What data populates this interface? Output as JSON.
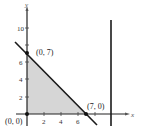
{
  "diagram": {
    "type": "feasible-region-graph",
    "axes": {
      "x_label": "x",
      "y_label": "y"
    },
    "y_ticks": [
      "2",
      "4",
      "6",
      "10"
    ],
    "x_ticks": [
      "2",
      "4",
      "6"
    ],
    "points": [
      {
        "label": "(0, 7)",
        "x": 0,
        "y": 7
      },
      {
        "label": "(7, 0)",
        "x": 7,
        "y": 0
      },
      {
        "label": "(0, 0)",
        "x": 0,
        "y": 0
      }
    ],
    "lines": [
      {
        "equation": "x + y = 7"
      },
      {
        "equation": "x = 10",
        "style": "vertical"
      }
    ],
    "shaded_region": "triangle with vertices (0,0), (0,7), (7,0)",
    "colors": {
      "shade": "#d6d6d6",
      "line": "#1a1a1a"
    }
  }
}
